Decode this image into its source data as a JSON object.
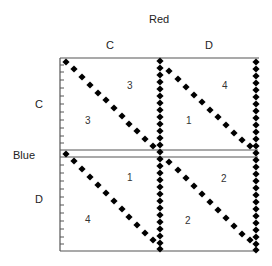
{
  "diagram": {
    "column_player": "Red",
    "row_player": "Blue",
    "column_strategies": [
      "C",
      "D"
    ],
    "row_strategies": [
      "C",
      "D"
    ],
    "cells": [
      {
        "row": "C",
        "col": "C",
        "blue_payoff": "3",
        "red_payoff": "3"
      },
      {
        "row": "C",
        "col": "D",
        "blue_payoff": "1",
        "red_payoff": "4"
      },
      {
        "row": "D",
        "col": "C",
        "blue_payoff": "4",
        "red_payoff": "1"
      },
      {
        "row": "D",
        "col": "D",
        "blue_payoff": "2",
        "red_payoff": "2"
      }
    ],
    "colors": {
      "line": "#555555",
      "marker": "#000000",
      "background": "#ffffff"
    }
  }
}
